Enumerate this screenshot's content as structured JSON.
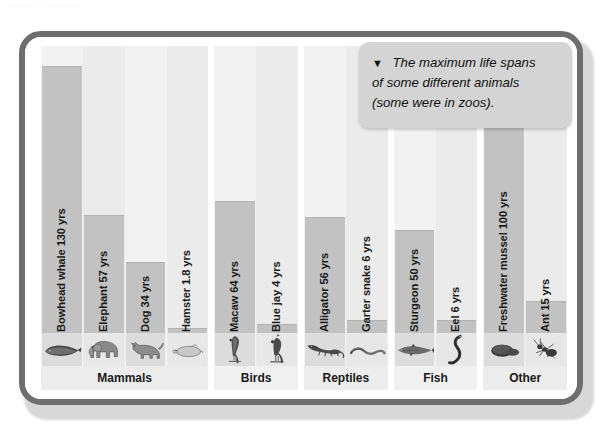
{
  "figure": {
    "faint_header": "Animal Life Spans",
    "callout": {
      "arrow": "▼",
      "line1": "The maximum life spans",
      "line2": "of some different animals",
      "line3": "(some were in zoos)."
    },
    "colors": {
      "frame": "#6e6e6e",
      "bar": "#c2c2c2",
      "plot_background": "#f3f3f3",
      "callout": "#d4d4d4",
      "gridline": "#ffffff",
      "text": "#1a1a1a"
    }
  },
  "chart_data": {
    "type": "bar",
    "title": "The maximum life spans of some different animals (some were in zoos).",
    "xlabel": "",
    "ylabel": "Maximum life span (yrs)",
    "ylim": [
      0,
      140
    ],
    "grid": true,
    "legend": "none",
    "orientation": "vertical",
    "categories": [
      "Bowhead whale",
      "Elephant",
      "Dog",
      "Hamster",
      "Macaw",
      "Blue jay",
      "Alligator",
      "Garter snake",
      "Sturgeon",
      "Eel",
      "Freshwater mussel",
      "Ant"
    ],
    "values": [
      130,
      57,
      34,
      1.8,
      64,
      4,
      56,
      6,
      50,
      6,
      100,
      15
    ],
    "units": "yrs",
    "groups": [
      {
        "label": "Mammals",
        "members": [
          "Bowhead whale",
          "Elephant",
          "Dog",
          "Hamster"
        ]
      },
      {
        "label": "Birds",
        "members": [
          "Macaw",
          "Blue jay"
        ]
      },
      {
        "label": "Reptiles",
        "members": [
          "Alligator",
          "Garter snake"
        ]
      },
      {
        "label": "Fish",
        "members": [
          "Sturgeon",
          "Eel"
        ]
      },
      {
        "label": "Other",
        "members": [
          "Freshwater mussel",
          "Ant"
        ]
      }
    ],
    "bars": [
      {
        "name": "Bowhead whale",
        "value": 130,
        "label": "Bowhead whale 130 yrs",
        "group": "Mammals",
        "icon": "whale-icon"
      },
      {
        "name": "Elephant",
        "value": 57,
        "label": "Elephant 57 yrs",
        "group": "Mammals",
        "icon": "elephant-icon"
      },
      {
        "name": "Dog",
        "value": 34,
        "label": "Dog 34 yrs",
        "group": "Mammals",
        "icon": "dog-icon"
      },
      {
        "name": "Hamster",
        "value": 1.8,
        "label": "Hamster 1.8 yrs",
        "group": "Mammals",
        "icon": "hamster-icon"
      },
      {
        "name": "Macaw",
        "value": 64,
        "label": "Macaw 64 yrs",
        "group": "Birds",
        "icon": "macaw-icon"
      },
      {
        "name": "Blue jay",
        "value": 4,
        "label": "Blue jay 4 yrs",
        "group": "Birds",
        "icon": "bluejay-icon"
      },
      {
        "name": "Alligator",
        "value": 56,
        "label": "Alligator 56 yrs",
        "group": "Reptiles",
        "icon": "alligator-icon"
      },
      {
        "name": "Garter snake",
        "value": 6,
        "label": "Garter snake 6 yrs",
        "group": "Reptiles",
        "icon": "snake-icon"
      },
      {
        "name": "Sturgeon",
        "value": 50,
        "label": "Sturgeon 50 yrs",
        "group": "Fish",
        "icon": "sturgeon-icon"
      },
      {
        "name": "Eel",
        "value": 6,
        "label": "Eel 6 yrs",
        "group": "Fish",
        "icon": "eel-icon"
      },
      {
        "name": "Freshwater mussel",
        "value": 100,
        "label": "Freshwater mussel 100 yrs",
        "group": "Other",
        "icon": "mussel-icon"
      },
      {
        "name": "Ant",
        "value": 15,
        "label": "Ant 15 yrs",
        "group": "Other",
        "icon": "ant-icon"
      }
    ],
    "group_labels": [
      "Mammals",
      "Birds",
      "Reptiles",
      "Fish",
      "Other"
    ]
  }
}
